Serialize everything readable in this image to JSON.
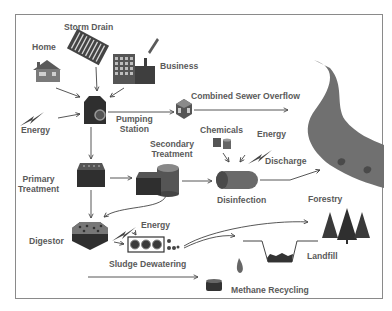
{
  "diagram": {
    "colors": {
      "frame": "#8a8a8a",
      "label": "#5a5a5a",
      "icon_dark": "#3a3a3a",
      "icon_mid": "#6a6a6a",
      "river": "#707070",
      "arrow": "#444444"
    },
    "sources": {
      "home": {
        "label": "Home",
        "icon": "house-icon"
      },
      "storm_drain": {
        "label": "Storm Drain",
        "icon": "grate-icon"
      },
      "business": {
        "label": "Business",
        "icon": "factory-icon"
      }
    },
    "nodes": {
      "energy_1": {
        "label": "Energy",
        "icon": "lightning-icon"
      },
      "pumping_station": {
        "label_line1": "Pumping",
        "label_line2": "Station",
        "icon": "pump-icon"
      },
      "combined_sewer_overflow": {
        "label": "Combined Sewer Overflow",
        "icon": "cube-icon"
      },
      "primary_treatment": {
        "label_line1": "Primary",
        "label_line2": "Treatment",
        "icon": "tank-icon"
      },
      "secondary_treatment": {
        "label_line1": "Secondary",
        "label_line2": "Treatment",
        "icon": "tank-cylinder-icon"
      },
      "chemicals": {
        "label": "Chemicals",
        "icon": "barrels-icon"
      },
      "energy_2": {
        "label": "Energy",
        "icon": "lightning-icon"
      },
      "discharge": {
        "label": "Discharge"
      },
      "disinfection": {
        "label": "Disinfection",
        "icon": "cylinder-icon"
      },
      "digestor": {
        "label": "Digestor",
        "icon": "digestor-icon"
      },
      "energy_3": {
        "label": "Energy",
        "icon": "lightning-icon"
      },
      "sludge_dewatering": {
        "label": "Sludge Dewatering",
        "icon": "press-icon"
      },
      "forestry": {
        "label": "Forestry",
        "icon": "trees-icon"
      },
      "landfill": {
        "label": "Landfill",
        "icon": "landfill-icon"
      },
      "methane_recycling": {
        "label": "Methane Recycling",
        "icon": "gas-drop-icon"
      },
      "river": {
        "icon": "river-icon"
      }
    }
  }
}
